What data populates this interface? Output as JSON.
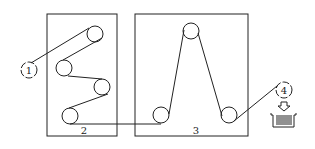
{
  "diagram": {
    "labels": {
      "unit1": "1",
      "unit2": "2",
      "unit3": "3",
      "unit4": "4"
    },
    "colors": {
      "stroke": "#222222",
      "background": "#ffffff"
    }
  }
}
